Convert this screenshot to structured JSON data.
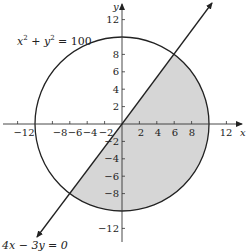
{
  "diagram": {
    "title": "",
    "circle_equation": {
      "base1": "x",
      "sup1": "2",
      "op": " + ",
      "base2": "y",
      "sup2": "2",
      "rest": " = 100"
    },
    "line_equation": "4x − 3y = 0",
    "axes": {
      "x_label": "x",
      "y_label": "y",
      "x_ticks": [
        "−12",
        "−8",
        "−6",
        "−4",
        "−2",
        "2",
        "4",
        "6",
        "8",
        "12"
      ],
      "y_ticks": [
        "12",
        "8",
        "6",
        "4",
        "2",
        "−2",
        "−4",
        "−6",
        "−8",
        "−12"
      ]
    },
    "colors": {
      "shade": "#d6d6d6",
      "stroke": "#222222"
    },
    "shaded_region": "Part of disk x²+y²≤100 below/right of the line 4x−3y=0"
  }
}
